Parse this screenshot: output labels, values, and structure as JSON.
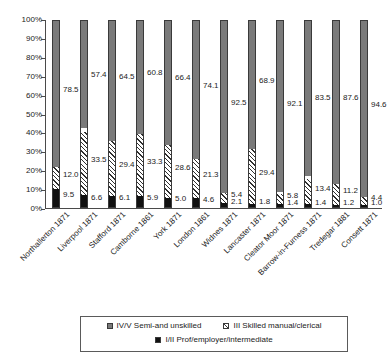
{
  "chart_data": {
    "type": "bar",
    "subtype": "stacked-column-100",
    "title": "",
    "xlabel": "",
    "ylabel": "",
    "ylim": [
      0,
      100
    ],
    "ytick_labels": [
      "100%",
      "90%",
      "80%",
      "70%",
      "60%",
      "50%",
      "40%",
      "30%",
      "20%",
      "10%",
      "0%"
    ],
    "ytick_values": [
      100,
      90,
      80,
      70,
      60,
      50,
      40,
      30,
      20,
      10,
      0
    ],
    "grid": false,
    "legend_position": "bottom",
    "categories": [
      "Northallerton 1871",
      "Liverpool 1871",
      "Stafford 1871",
      "Camborne 1861",
      "York 1871",
      "London 1861",
      "Widnes 1871",
      "Lancaster 1871",
      "Cleator Moor 1871",
      "Barrow-in-Furness 1871",
      "Tredegar 1881",
      "Consett 1871"
    ],
    "series": [
      {
        "name": "I/II Prof/employer/intermediate",
        "key": "bottom",
        "color": "#111111",
        "pattern": "solid-black",
        "values": [
          9.5,
          6.6,
          6.1,
          5.9,
          5.0,
          4.6,
          2.1,
          1.8,
          1.4,
          1.4,
          1.2,
          1.0
        ]
      },
      {
        "name": "III Skilled manual/clerical",
        "key": "middle",
        "color": "#ffffff",
        "pattern": "diagonal-hatch",
        "values": [
          12.0,
          33.5,
          29.4,
          33.3,
          28.6,
          21.3,
          5.4,
          29.4,
          5.8,
          13.4,
          11.2,
          4.4
        ]
      },
      {
        "name": "IV/V Semi-and unskilled",
        "key": "top",
        "color": "#7a7a7a",
        "pattern": "solid-grey",
        "values": [
          78.5,
          57.4,
          64.5,
          60.8,
          66.4,
          74.1,
          92.5,
          68.9,
          92.1,
          83.5,
          87.6,
          94.6
        ]
      }
    ]
  },
  "legend": {
    "items": [
      {
        "label": "IV/V Semi-and unskilled",
        "swatch": "grey"
      },
      {
        "label": "III Skilled manual/clerical",
        "swatch": "hatch"
      },
      {
        "label": "I/II Prof/employer/intermediate",
        "swatch": "black"
      }
    ]
  }
}
